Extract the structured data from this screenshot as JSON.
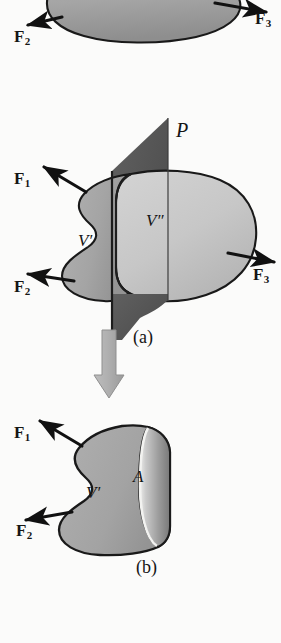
{
  "figure": {
    "background_color": "#fbfbfa",
    "outline_color": "#1a1a1a",
    "body_fill_left": "#a9a9a9",
    "body_fill_right": "#c6c6c6",
    "plane_fill": "#565656",
    "section_fill": "#9c9c9c",
    "arrow_color": "#111111",
    "flow_arrow_color": "#a8a8a8"
  },
  "panel_top": {
    "forces": [
      {
        "name": "F2",
        "base": "F",
        "sub": "2"
      },
      {
        "name": "F3",
        "base": "F",
        "sub": "3"
      }
    ]
  },
  "panel_a": {
    "caption": "(a)",
    "plane_label": "𝒫",
    "plane_label_plain": "P",
    "volume_left": "V′",
    "volume_right": "V″",
    "forces": [
      {
        "name": "F1",
        "base": "F",
        "sub": "1"
      },
      {
        "name": "F2",
        "base": "F",
        "sub": "2"
      },
      {
        "name": "F3",
        "base": "F",
        "sub": "3"
      }
    ]
  },
  "panel_b": {
    "caption": "(b)",
    "volume_left": "V′",
    "area_label": "A",
    "forces": [
      {
        "name": "F1",
        "base": "F",
        "sub": "1"
      },
      {
        "name": "F2",
        "base": "F",
        "sub": "2"
      }
    ]
  }
}
